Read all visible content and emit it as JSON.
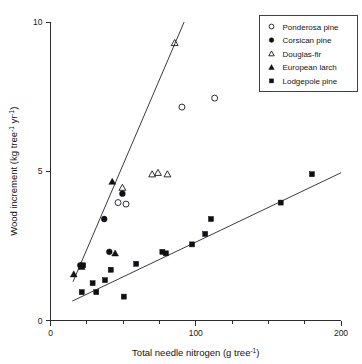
{
  "chart_data": {
    "type": "scatter",
    "title": "",
    "xlabel": "Total needle nitrogen (g tree-1)",
    "xlabel_main": "Total needle nitrogen (g tree",
    "xlabel_sup": "-1",
    "xlabel_tail": ")",
    "ylabel": "Wood increment (kg tree-1 yr-1)",
    "ylabel_part1": "Wood increment (kg tree",
    "ylabel_sup1": "-1",
    "ylabel_part2": " yr",
    "ylabel_sup2": "-1",
    "ylabel_part3": ")",
    "xlim": [
      0,
      200
    ],
    "ylim": [
      0,
      10
    ],
    "xticks": [
      0,
      100,
      200
    ],
    "xtick_labels": [
      "0",
      "100",
      "200"
    ],
    "xticks_minor": [
      25,
      50,
      75,
      125,
      150,
      175
    ],
    "yticks": [
      0,
      5,
      10
    ],
    "ytick_labels": [
      "0",
      "5",
      "10"
    ],
    "grid": false,
    "legend_position": "top-right",
    "series": [
      {
        "name": "Ponderosa pine",
        "marker": "open-circle",
        "points": [
          {
            "x": 46.5,
            "y": 3.95
          },
          {
            "x": 52.0,
            "y": 3.9
          },
          {
            "x": 90.5,
            "y": 7.15
          },
          {
            "x": 113.0,
            "y": 7.45
          }
        ]
      },
      {
        "name": "Corsican pine",
        "marker": "filled-circle",
        "points": [
          {
            "x": 20.5,
            "y": 1.85
          },
          {
            "x": 37.0,
            "y": 3.4
          },
          {
            "x": 40.5,
            "y": 2.3
          },
          {
            "x": 49.5,
            "y": 4.25
          }
        ]
      },
      {
        "name": "Douglas-fir",
        "marker": "open-triangle",
        "points": [
          {
            "x": 49.5,
            "y": 4.45
          },
          {
            "x": 70.0,
            "y": 4.9
          },
          {
            "x": 74.0,
            "y": 4.95
          },
          {
            "x": 80.5,
            "y": 4.9
          },
          {
            "x": 85.5,
            "y": 9.3
          }
        ]
      },
      {
        "name": "European larch",
        "marker": "filled-triangle",
        "points": [
          {
            "x": 16.0,
            "y": 1.55
          },
          {
            "x": 21.5,
            "y": 1.8
          },
          {
            "x": 42.5,
            "y": 4.65
          },
          {
            "x": 44.5,
            "y": 2.25
          }
        ]
      },
      {
        "name": "Lodgepole pine",
        "marker": "filled-square",
        "points": [
          {
            "x": 21.5,
            "y": 0.95
          },
          {
            "x": 22.5,
            "y": 1.85
          },
          {
            "x": 29.0,
            "y": 1.25
          },
          {
            "x": 31.5,
            "y": 0.95
          },
          {
            "x": 37.5,
            "y": 1.35
          },
          {
            "x": 41.5,
            "y": 1.7
          },
          {
            "x": 50.5,
            "y": 0.8
          },
          {
            "x": 59.0,
            "y": 1.9
          },
          {
            "x": 77.0,
            "y": 2.3
          },
          {
            "x": 79.5,
            "y": 2.25
          },
          {
            "x": 97.5,
            "y": 2.55
          },
          {
            "x": 106.5,
            "y": 2.9
          },
          {
            "x": 110.5,
            "y": 3.4
          },
          {
            "x": 158.5,
            "y": 3.95
          },
          {
            "x": 180.0,
            "y": 4.9
          }
        ]
      }
    ],
    "trendlines": [
      {
        "name": "conifer-upper-regression",
        "x0": 15.5,
        "y0": 1.3,
        "x1": 92.0,
        "y1": 10.0
      },
      {
        "name": "lodgepole-lower-regression",
        "x0": 15.0,
        "y0": 0.65,
        "x1": 200.0,
        "y1": 4.95
      }
    ],
    "legend": {
      "entries": [
        {
          "label": "Ponderosa pine",
          "marker": "open-circle"
        },
        {
          "label": "Corsican pine",
          "marker": "filled-circle"
        },
        {
          "label": "Douglas-fir",
          "marker": "open-triangle"
        },
        {
          "label": "European larch",
          "marker": "filled-triangle"
        },
        {
          "label": "Lodgepole pine",
          "marker": "filled-square"
        }
      ]
    },
    "colors": {
      "axis": "#2b2b2b",
      "marker": "#101014",
      "line": "#3a3a46",
      "background": "#ffffff"
    }
  }
}
